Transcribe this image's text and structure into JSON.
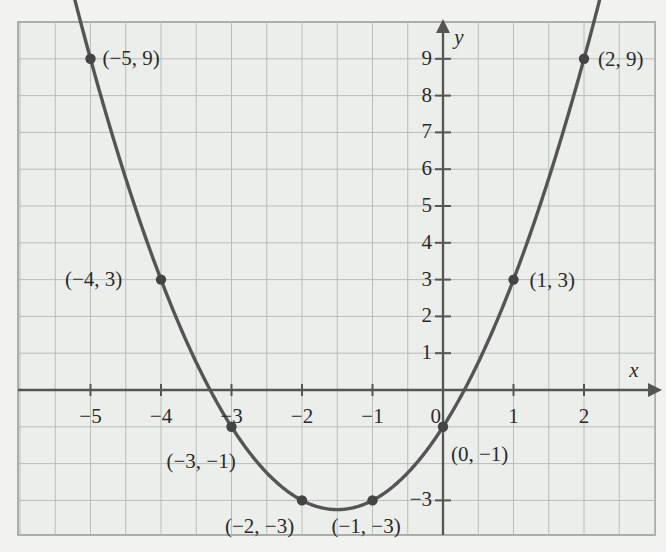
{
  "figure": {
    "background_color": "#f2f2f0",
    "plot_background_color": "#eceeec",
    "grid_color": "#b9bcb9",
    "grid_minor_color": "#d4d6d4",
    "axis_color": "#555555",
    "curve_color": "#555555",
    "point_color": "#444444",
    "border_color": "#9a9d9a"
  },
  "axes": {
    "x_axis_name": "x",
    "y_axis_name": "y",
    "origin_label": "0"
  },
  "chart_data": {
    "type": "line",
    "title": "",
    "xlabel": "x",
    "ylabel": "y",
    "grid": true,
    "legend": "none",
    "equation": "y = x^2 + 3x - 1",
    "xlim": [
      -6.07,
      3.03
    ],
    "ylim": [
      -4.0,
      10.3
    ],
    "x_ticks": [
      -5,
      -4,
      -3,
      -2,
      -1,
      0,
      1,
      2
    ],
    "x_tick_labels": [
      "−5",
      "−4",
      "−3",
      "−2",
      "−1",
      "0",
      "1",
      "2"
    ],
    "y_ticks": [
      -3,
      1,
      2,
      3,
      4,
      5,
      6,
      7,
      8,
      9
    ],
    "y_tick_labels": [
      "−3",
      "1",
      "2",
      "3",
      "4",
      "5",
      "6",
      "7",
      "8",
      "9"
    ],
    "x": [
      -5,
      -4,
      -3,
      -2,
      -1,
      0,
      1,
      2
    ],
    "values": [
      9,
      3,
      -1,
      -3,
      -3,
      -1,
      3,
      9
    ],
    "points": [
      {
        "x": -5,
        "y": 9,
        "label": "(−5, 9)",
        "label_dx": 12,
        "label_dy": -11
      },
      {
        "x": -4,
        "y": 3,
        "label": "(−4, 3)",
        "label_dx": -96,
        "label_dy": -11
      },
      {
        "x": -3,
        "y": -1,
        "label": "(−3, −1)",
        "label_dx": -65,
        "label_dy": 24
      },
      {
        "x": -2,
        "y": -3,
        "label": "(−2, −3)",
        "label_dx": -77,
        "label_dy": 16
      },
      {
        "x": -1,
        "y": -3,
        "label": "(−1, −3)",
        "label_dx": -41,
        "label_dy": 16
      },
      {
        "x": 0,
        "y": -1,
        "label": "(0, −1)",
        "label_dx": 8,
        "label_dy": 17
      },
      {
        "x": 1,
        "y": 3,
        "label": "(1, 3)",
        "label_dx": 16,
        "label_dy": -10
      },
      {
        "x": 2,
        "y": 9,
        "label": "(2, 9)",
        "label_dx": 14,
        "label_dy": -10
      }
    ]
  }
}
